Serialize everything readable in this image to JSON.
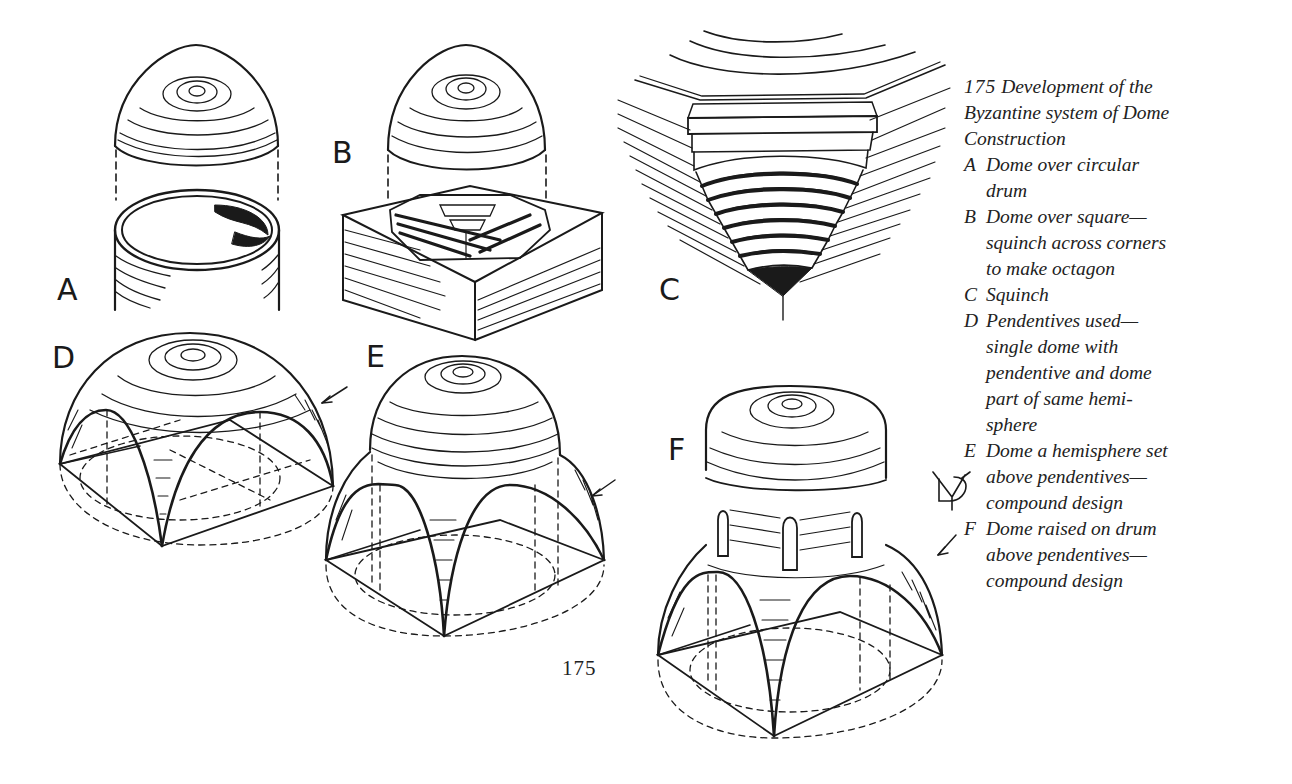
{
  "figure": {
    "number": "175",
    "title_lines": [
      "Development of the",
      "Byzantine system of Dome",
      "Construction"
    ],
    "panels": [
      {
        "key": "A",
        "lines": [
          "Dome over circular",
          "drum"
        ]
      },
      {
        "key": "B",
        "lines": [
          "Dome over square—",
          "squinch across corners",
          "to make octagon"
        ]
      },
      {
        "key": "C",
        "lines": [
          "Squinch"
        ]
      },
      {
        "key": "D",
        "lines": [
          "Pendentives used—",
          "single dome with",
          "pendentive and dome",
          "part of same hemi-",
          "sphere"
        ]
      },
      {
        "key": "E",
        "lines": [
          "Dome a hemisphere set",
          "above pendentives—",
          "compound design"
        ]
      },
      {
        "key": "F",
        "lines": [
          "Dome raised on drum",
          "above pendentives—",
          "compound design"
        ]
      }
    ],
    "drawing_labels": {
      "a": "A",
      "b": "B",
      "c": "C",
      "d": "D",
      "e": "E",
      "f": "F"
    },
    "pendentive_symbol": "pendentive-mark-icon"
  },
  "page": {
    "number": "175"
  },
  "colors": {
    "ink": "#1a1a1a",
    "paper": "#ffffff"
  }
}
